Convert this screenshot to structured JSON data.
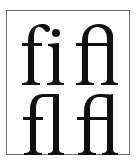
{
  "figure": {
    "border_color": "#6f6f6f",
    "ink_color": "#111111",
    "cells": [
      {
        "text": "fi",
        "variant": "standard ligature"
      },
      {
        "text": "fi",
        "variant": "joined-arch ligature"
      },
      {
        "text": "fl",
        "variant": "standard ligature"
      },
      {
        "text": "fl",
        "variant": "joined-arch ligature"
      }
    ]
  }
}
